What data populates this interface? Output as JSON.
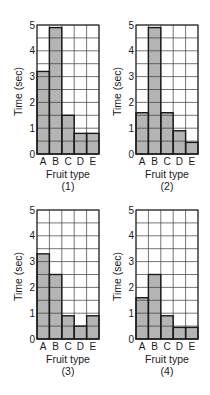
{
  "figure": {
    "ylabel": "Time (sec)",
    "xlabel": "Fruit type",
    "categories": [
      "A",
      "B",
      "C",
      "D",
      "E"
    ],
    "yticks": [
      "0",
      "1",
      "2",
      "3",
      "4",
      "5"
    ],
    "colors": {
      "bar_fill": "#b4b4b4",
      "grid": "#3a3a3a",
      "bar_edge": "#1a1a1a",
      "background": "#ffffff"
    }
  },
  "chart_data": [
    {
      "type": "bar",
      "title": "(1)",
      "categories": [
        "A",
        "B",
        "C",
        "D",
        "E"
      ],
      "values": [
        3.2,
        4.9,
        1.5,
        0.8,
        0.8
      ],
      "xlabel": "Fruit type",
      "ylabel": "Time (sec)",
      "ylim": [
        0,
        5
      ],
      "grid": true,
      "grid_step": 0.5
    },
    {
      "type": "bar",
      "title": "(2)",
      "categories": [
        "A",
        "B",
        "C",
        "D",
        "E"
      ],
      "values": [
        1.6,
        4.9,
        1.6,
        0.9,
        0.45
      ],
      "xlabel": "Fruit type",
      "ylabel": "Time (sec)",
      "ylim": [
        0,
        5
      ],
      "grid": true,
      "grid_step": 0.5
    },
    {
      "type": "bar",
      "title": "(3)",
      "categories": [
        "A",
        "B",
        "C",
        "D",
        "E"
      ],
      "values": [
        3.3,
        2.5,
        0.9,
        0.5,
        0.9
      ],
      "xlabel": "Fruit type",
      "ylabel": "Time (sec)",
      "ylim": [
        0,
        5
      ],
      "grid": true,
      "grid_step": 0.5
    },
    {
      "type": "bar",
      "title": "(4)",
      "categories": [
        "A",
        "B",
        "C",
        "D",
        "E"
      ],
      "values": [
        1.6,
        2.5,
        0.9,
        0.45,
        0.45
      ],
      "xlabel": "Fruit type",
      "ylabel": "Time (sec)",
      "ylim": [
        0,
        5
      ],
      "grid": true,
      "grid_step": 0.5
    }
  ]
}
